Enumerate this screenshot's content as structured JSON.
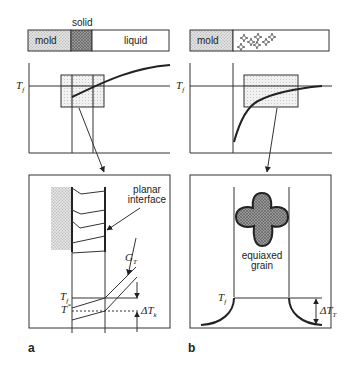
{
  "panel_a": {
    "label": "a",
    "bar": {
      "mold": "mold",
      "solid": "solid",
      "liquid": "liquid"
    },
    "graph": {
      "tf_label": "T",
      "tf_sub": "f"
    },
    "detail": {
      "planar_interface_line1": "planar",
      "planar_interface_line2": "interface",
      "gt_label": "G",
      "gt_sub": "T",
      "tf_label": "T",
      "tf_sub": "f",
      "tstar_label": "T",
      "tstar_sup": "*",
      "delta_label": "ΔT",
      "delta_sub": "k"
    }
  },
  "panel_b": {
    "label": "b",
    "bar": {
      "mold": "mold"
    },
    "graph": {
      "tf_label": "T",
      "tf_sub": "f"
    },
    "detail": {
      "grain_line1": "equiaxed",
      "grain_line2": "grain",
      "tf_label": "T",
      "tf_sub": "f",
      "delta_label": "ΔT",
      "delta_sub": "T"
    }
  },
  "colors": {
    "line": "#333333",
    "stipple_light": "#c8c8c8",
    "stipple_dark": "#8a8a8a",
    "background": "#ffffff"
  }
}
